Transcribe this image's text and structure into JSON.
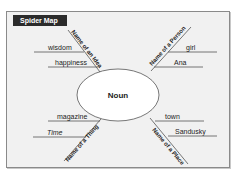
{
  "title": "Spider Map",
  "center": "Noun",
  "legs": [
    {
      "category": "Name of an Idea",
      "examples": [
        "wisdom",
        "happiness"
      ]
    },
    {
      "category": "Name of a Person",
      "examples": [
        "girl",
        "Ana"
      ]
    },
    {
      "category": "Name of a Thing",
      "examples": [
        "magazine",
        "Time"
      ]
    },
    {
      "category": "Name of a Place",
      "examples": [
        "town",
        "Sandusky"
      ]
    }
  ],
  "colors": {
    "panel": "#f1f1f1",
    "title_bg": "#2b2b2b",
    "line": "#555555"
  }
}
